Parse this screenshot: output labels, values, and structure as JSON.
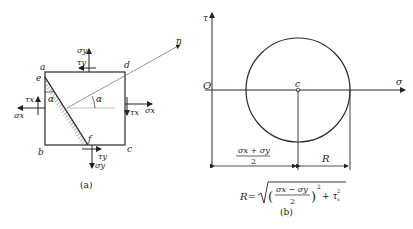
{
  "figure_a": {
    "caption": "(a)",
    "vertices": {
      "a": "a",
      "b": "b",
      "c": "c",
      "d": "d",
      "e": "e",
      "f": "f"
    },
    "normal_label": "n",
    "angle_label_1": "α",
    "angle_label_2": "α",
    "stress_labels": {
      "sigma_y_top": "σy",
      "tau_y_top": "τy",
      "sigma_x_left": "σx",
      "tau_x_left": "τx",
      "sigma_x_right": "σx",
      "tau_x_right": "τx",
      "tau_y_bottom": "τy",
      "sigma_y_bottom": "σy"
    }
  },
  "figure_b": {
    "caption": "(b)",
    "axis_tau": "τ",
    "axis_sigma": "σ",
    "origin": "O",
    "center": "c",
    "center_dim_numerator": "σx + σy",
    "center_dim_denominator": "2",
    "radius_dim": "R",
    "formula": {
      "lhs": "R=",
      "inner_numerator": "σx − σy",
      "inner_denominator": "2",
      "exponent": "2",
      "tail": "+ τ",
      "tail_sub": "x",
      "tail_sup": "2"
    }
  },
  "colors": {
    "line": "#2a2a2a",
    "text": "#222222",
    "background": "#ffffff"
  }
}
